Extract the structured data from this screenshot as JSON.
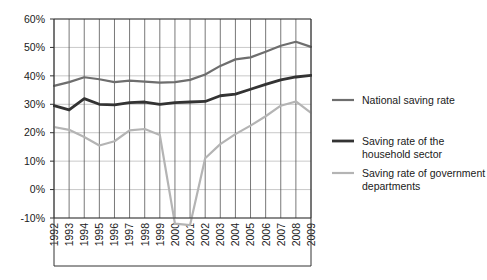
{
  "chart_data": {
    "type": "line",
    "title": "",
    "subtitle": "",
    "xlabel": "",
    "ylabel": "",
    "grid": "vertical-major-and-horizontal",
    "legend_position": "right",
    "xlim": [
      1992,
      2009
    ],
    "ylim": [
      -10,
      60
    ],
    "ytick_labels": [
      "60%",
      "50%",
      "40%",
      "30%",
      "20%",
      "10%",
      "0%",
      "-10%"
    ],
    "ytick_values": [
      60,
      50,
      40,
      30,
      20,
      10,
      0,
      -10
    ],
    "categories": [
      "1992",
      "1993",
      "1994",
      "1995",
      "1996",
      "1997",
      "1998",
      "1999",
      "2000",
      "2001",
      "2002",
      "2003",
      "2004",
      "2005",
      "2006",
      "2007",
      "2008",
      "2009"
    ],
    "series": [
      {
        "name": "National saving rate",
        "color": "#6e6e6e",
        "values": [
          36.5,
          37.8,
          39.5,
          38.8,
          37.8,
          38.3,
          38.0,
          37.6,
          37.8,
          38.6,
          40.5,
          43.5,
          45.8,
          46.5,
          48.5,
          50.6,
          52.0,
          50.2
        ]
      },
      {
        "name": "Saving rate of the household sector",
        "color": "#333333",
        "values": [
          29.5,
          28.0,
          32.0,
          30.0,
          29.8,
          30.6,
          30.8,
          30.0,
          30.6,
          30.8,
          31.0,
          33.0,
          33.6,
          35.3,
          37.0,
          38.6,
          39.6,
          40.2
        ]
      },
      {
        "name": "Saving rate of government departments",
        "color": "#b4b4b4",
        "values": [
          22.0,
          21.0,
          18.5,
          15.5,
          17.0,
          20.8,
          21.3,
          19.2,
          -12.0,
          -12.5,
          11.0,
          16.0,
          19.5,
          22.5,
          25.8,
          29.5,
          31.0,
          27.0
        ]
      }
    ],
    "legend_entries": [
      {
        "label": "National saving rate",
        "color": "#6e6e6e",
        "thickness": 2.2
      },
      {
        "label": "Saving rate of the household sector",
        "color": "#333333",
        "thickness": 2.8
      },
      {
        "label": "Saving rate of government departments",
        "color": "#b4b4b4",
        "thickness": 2.2
      }
    ]
  },
  "plot_geometry": {
    "left": 54,
    "right": 311,
    "top": 19,
    "bottom": 218
  }
}
